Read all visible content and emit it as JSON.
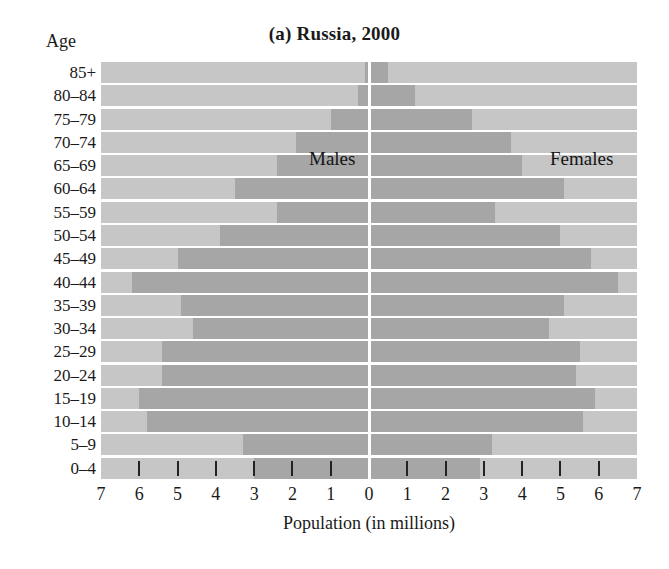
{
  "title": {
    "prefix": "(a) ",
    "text": "Russia, 2000",
    "full": "(a) Russia, 2000"
  },
  "axes": {
    "y_axis_label": "Age",
    "x_axis_label": "Population (in millions)",
    "x_tick_labels": [
      "7",
      "6",
      "5",
      "4",
      "3",
      "2",
      "1",
      "0",
      "1",
      "2",
      "3",
      "4",
      "5",
      "6",
      "7"
    ],
    "x_min": -7,
    "x_max": 7
  },
  "series_labels": {
    "males": "Males",
    "females": "Females"
  },
  "colors": {
    "bar": "#a6a6a6",
    "plot_background": "#c6c6c6",
    "center_line": "#ffffff",
    "tick": "#222222",
    "text": "#1a1a1a",
    "page_background": "#ffffff"
  },
  "chart_data": {
    "type": "bar",
    "subtype": "population-pyramid",
    "title": "(a) Russia, 2000",
    "xlabel": "Population (in millions)",
    "ylabel": "Age",
    "xlim": [
      -7,
      7
    ],
    "xticks": [
      -7,
      -6,
      -5,
      -4,
      -3,
      -2,
      -1,
      0,
      1,
      2,
      3,
      4,
      5,
      6,
      7
    ],
    "xtick_labels": [
      "7",
      "6",
      "5",
      "4",
      "3",
      "2",
      "1",
      "0",
      "1",
      "2",
      "3",
      "4",
      "5",
      "6",
      "7"
    ],
    "grid": false,
    "legend": "in-plot text labels",
    "orientation": "horizontal",
    "categories": [
      "85+",
      "80–84",
      "75–79",
      "70–74",
      "65–69",
      "60–64",
      "55–59",
      "50–54",
      "45–49",
      "40–44",
      "35–39",
      "30–34",
      "25–29",
      "20–24",
      "15–19",
      "10–14",
      "5–9",
      "0–4"
    ],
    "series": [
      {
        "name": "Males",
        "side": "left",
        "units": "millions",
        "values": [
          0.1,
          0.3,
          1.0,
          1.9,
          2.4,
          3.5,
          2.4,
          3.9,
          5.0,
          6.2,
          4.9,
          4.6,
          5.4,
          5.4,
          6.0,
          5.8,
          3.3,
          3.0
        ]
      },
      {
        "name": "Females",
        "side": "right",
        "units": "millions",
        "values": [
          0.5,
          1.2,
          2.7,
          3.7,
          4.0,
          5.1,
          3.3,
          5.0,
          5.8,
          6.5,
          5.1,
          4.7,
          5.5,
          5.4,
          5.9,
          5.6,
          3.2,
          2.9
        ]
      }
    ]
  }
}
